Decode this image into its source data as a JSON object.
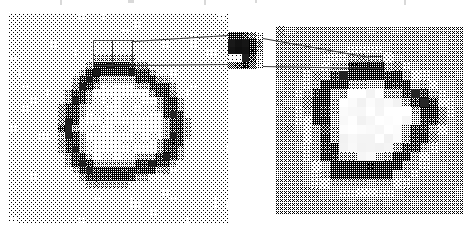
{
  "figure": {
    "kind": "image-pair-with-magnified-inset",
    "panels": [
      {
        "id": "left-panel",
        "role": "original-image",
        "label": "",
        "x": 9,
        "y": 13,
        "width": 219,
        "height": 211,
        "background_hex": "#e8e8e8",
        "content": "dark pixelated ring on light gray background",
        "block_size_px": 7,
        "ring": {
          "center_x": 110,
          "center_y": 118,
          "outer_radius": 59,
          "inner_radius": 45,
          "ring_hex": "#1a1a1a",
          "interior_hex": "#e6e6e6",
          "halo": false
        },
        "callout": {
          "x": 93,
          "y": 40,
          "width": 40,
          "height": 26
        }
      },
      {
        "id": "right-panel",
        "role": "processed-image",
        "label": "",
        "x": 276,
        "y": 26,
        "width": 187,
        "height": 188,
        "background_hex": "#b4b4b4",
        "content": "dark pixelated ring with bright white halo on mid gray background",
        "block_size_px": 9,
        "ring": {
          "center_x": 370,
          "center_y": 122,
          "outer_radius": 56,
          "inner_radius": 40,
          "ring_hex": "#121212",
          "interior_hex": "#fafafa",
          "halo": true,
          "halo_hex": "#f5f5f5"
        },
        "callout": {
          "x": 368,
          "y": 56,
          "width": 15,
          "height": 13
        }
      }
    ],
    "inset": {
      "id": "magnified-pixel-block",
      "role": "zoomed-pixel-detail",
      "x": 228,
      "y": 32,
      "width": 35,
      "height": 37,
      "cols": 5,
      "rows": 5,
      "block_values": [
        [
          60,
          70,
          95,
          150,
          205
        ],
        [
          25,
          18,
          22,
          60,
          150
        ],
        [
          20,
          15,
          18,
          55,
          170
        ],
        [
          235,
          240,
          30,
          95,
          205
        ],
        [
          120,
          95,
          40,
          120,
          215
        ]
      ],
      "note": "5x5 grid of magnified image pixels sampled from the top edge of the ring"
    },
    "leaders": [
      {
        "from": "left-callout-top-right",
        "to": "inset-left-top",
        "x1": 133,
        "y1": 41,
        "x2": 228,
        "y2": 35
      },
      {
        "from": "left-callout-bottom-right",
        "to": "inset-left-bottom",
        "x1": 133,
        "y1": 65,
        "x2": 228,
        "y2": 64
      },
      {
        "from": "inset-right-top",
        "to": "right-callout-top",
        "x1": 263,
        "y1": 38,
        "x2": 369,
        "y2": 57
      },
      {
        "from": "inset-right-bottom",
        "to": "right-callout-bot",
        "x1": 263,
        "y1": 66,
        "x2": 369,
        "y2": 68
      }
    ],
    "colors": {
      "page_background": "#ffffff",
      "line_hex": "#3c3c3c",
      "left_bg_hex": "#e8e8e8",
      "right_bg_hex": "#b4b4b4",
      "dark_hex": "#141414",
      "white_hex": "#fafafa"
    },
    "top_artifacts": [
      {
        "x": 60,
        "width": 2,
        "height": 5
      },
      {
        "x": 128,
        "width": 6,
        "height": 3
      },
      {
        "x": 204,
        "width": 2,
        "height": 5
      },
      {
        "x": 255,
        "width": 2,
        "height": 3
      },
      {
        "x": 404,
        "width": 2,
        "height": 5
      }
    ]
  }
}
